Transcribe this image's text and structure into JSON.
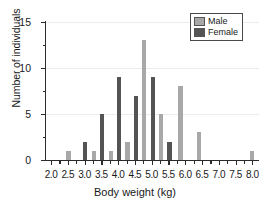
{
  "chart_data": {
    "type": "bar",
    "title": "",
    "xlabel": "Body weight (kg)",
    "ylabel": "Number of individuals",
    "xlim": [
      1.85,
      8.2
    ],
    "ylim": [
      0,
      15
    ],
    "grid": true,
    "legend_position": "top-right",
    "xticks": [
      "2.0",
      "2.5",
      "3.0",
      "3.5",
      "4.0",
      "4.5",
      "5.0",
      "5.5",
      "6.0",
      "6.5",
      "7.0",
      "7.5",
      "8.0"
    ],
    "xtick_values": [
      2.0,
      2.5,
      3.0,
      3.5,
      4.0,
      4.5,
      5.0,
      5.5,
      6.0,
      6.5,
      7.0,
      7.5,
      8.0
    ],
    "yticks": [
      "0",
      "5",
      "10",
      "15"
    ],
    "ytick_values": [
      0,
      5,
      10,
      15
    ],
    "yminor_values": [
      2.5,
      7.5,
      12.5
    ],
    "series": [
      {
        "name": "Male",
        "color": "#a8a8a8",
        "points": [
          {
            "x": 2.52,
            "y": 1
          },
          {
            "x": 3.28,
            "y": 1
          },
          {
            "x": 3.78,
            "y": 1
          },
          {
            "x": 4.28,
            "y": 2
          },
          {
            "x": 4.78,
            "y": 13
          },
          {
            "x": 5.28,
            "y": 5
          },
          {
            "x": 5.86,
            "y": 8
          },
          {
            "x": 6.4,
            "y": 3
          },
          {
            "x": 7.98,
            "y": 1
          }
        ]
      },
      {
        "name": "Female",
        "color": "#545454",
        "points": [
          {
            "x": 3.02,
            "y": 2
          },
          {
            "x": 3.53,
            "y": 5
          },
          {
            "x": 4.03,
            "y": 9
          },
          {
            "x": 4.53,
            "y": 7
          },
          {
            "x": 5.03,
            "y": 9
          },
          {
            "x": 5.53,
            "y": 2
          }
        ]
      }
    ]
  },
  "legend": {
    "items": [
      {
        "label": "Male",
        "color": "#a8a8a8"
      },
      {
        "label": "Female",
        "color": "#545454"
      }
    ]
  },
  "axes": {
    "x_title": "Body weight (kg)",
    "y_title": "Number of individuals"
  }
}
